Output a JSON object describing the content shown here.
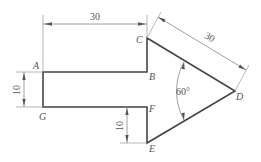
{
  "diagram": {
    "type": "engineering-drawing",
    "points": {
      "A": "A",
      "B": "B",
      "C": "C",
      "D": "D",
      "E": "E",
      "F": "F",
      "G": "G"
    },
    "dimensions": {
      "top_width": "30",
      "diagonal_cd": "30",
      "left_height": "10",
      "bottom_height": "10",
      "angle_d": "60°"
    },
    "colors": {
      "outline": "#444444",
      "dimension_lines": "#777777",
      "text": "#555555"
    }
  }
}
